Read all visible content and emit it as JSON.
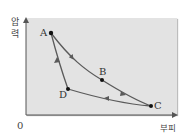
{
  "diagram": {
    "title": "",
    "axes": {
      "y_label": [
        "압",
        "력"
      ],
      "x_label": "부피",
      "origin": "0"
    },
    "points": [
      {
        "id": "A",
        "label": "A",
        "x": 51,
        "y": 33
      },
      {
        "id": "B",
        "label": "B",
        "x": 102,
        "y": 80
      },
      {
        "id": "C",
        "label": "C",
        "x": 151,
        "y": 106
      },
      {
        "id": "D",
        "label": "D",
        "x": 68,
        "y": 89
      }
    ],
    "paths": [
      {
        "from": "A",
        "to": "B",
        "direction": "A→B"
      },
      {
        "from": "B",
        "to": "C",
        "direction": "B→C"
      },
      {
        "from": "C",
        "to": "D",
        "direction": "C→D"
      },
      {
        "from": "D",
        "to": "A",
        "direction": "D→A"
      }
    ],
    "colors": {
      "plot_background": "#e3e3e3",
      "curve": "#5a5a5a",
      "point": "#111111",
      "axis": "#555555"
    }
  }
}
